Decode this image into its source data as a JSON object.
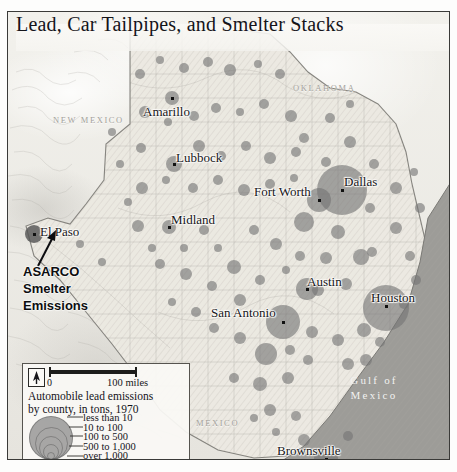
{
  "title": "Lead, Car Tailpipes, and Smelter Stacks",
  "regions": [
    {
      "name": "new-mexico",
      "label": "NEW MEXICO",
      "x": 45,
      "y": 103
    },
    {
      "name": "oklahoma",
      "label": "OKLAHOMA",
      "x": 285,
      "y": 71
    },
    {
      "name": "mexico",
      "label": "MEXICO",
      "x": 188,
      "y": 406
    }
  ],
  "water": {
    "name": "gulf-of-mexico",
    "line1": "Gulf of",
    "line2": "Mexico",
    "x": 366,
    "y": 381
  },
  "cities": [
    {
      "name": "amarillo",
      "label": "Amarillo",
      "lx": 135,
      "ly": 92,
      "dx": 164,
      "dy": 86
    },
    {
      "name": "lubbock",
      "label": "Lubbock",
      "lx": 168,
      "ly": 138,
      "dx": 166,
      "dy": 152
    },
    {
      "name": "midland",
      "label": "Midland",
      "lx": 163,
      "ly": 200,
      "dx": 161,
      "dy": 215
    },
    {
      "name": "el-paso",
      "label": "El Paso",
      "lx": 32,
      "ly": 212,
      "dx": 26,
      "dy": 222
    },
    {
      "name": "fort-worth",
      "label": "Fort Worth",
      "lx": 246,
      "ly": 172,
      "dx": 311,
      "dy": 188
    },
    {
      "name": "dallas",
      "label": "Dallas",
      "lx": 336,
      "ly": 162,
      "dx": 334,
      "dy": 178
    },
    {
      "name": "austin",
      "label": "Austin",
      "lx": 299,
      "ly": 262,
      "dx": 299,
      "dy": 277
    },
    {
      "name": "san-antonio",
      "label": "San Antonio",
      "lx": 203,
      "ly": 293,
      "dx": 275,
      "dy": 310
    },
    {
      "name": "houston",
      "label": "Houston",
      "lx": 363,
      "ly": 278,
      "dx": 378,
      "dy": 294
    },
    {
      "name": "brownsville",
      "label": "Brownsville",
      "lx": 269,
      "ly": 431,
      "dx": 318,
      "dy": 447
    }
  ],
  "annotation": {
    "name": "asarco-smelter-emissions",
    "lines": [
      "ASARCO",
      "Smelter",
      "Emissions"
    ]
  },
  "legend": {
    "scale_zero": "0",
    "scale_max": "100 miles",
    "caption_line1": "Automobile lead emissions",
    "caption_line2": "by county, in tons, 1970",
    "classes": [
      "less than 10",
      "10 to 100",
      "100 to 500",
      "500 to 1,000",
      "over 1,000"
    ],
    "class_radii_px": [
      3,
      7,
      11,
      15.5,
      21
    ],
    "north_arrow": "north-arrow-icon"
  },
  "chart_data": {
    "type": "map-proportional-symbols",
    "title": "Lead, Car Tailpipes, and Smelter Stacks",
    "variable": "Automobile lead emissions by county, in tons, 1970",
    "units": "tons",
    "year": 1970,
    "classes": [
      {
        "label": "less than 10",
        "min": 0,
        "max": 10
      },
      {
        "label": "10 to 100",
        "min": 10,
        "max": 100
      },
      {
        "label": "100 to 500",
        "min": 100,
        "max": 500
      },
      {
        "label": "500 to 1,000",
        "min": 500,
        "max": 1000
      },
      {
        "label": "over 1,000",
        "min": 1000,
        "max": null
      }
    ],
    "symbols": [
      {
        "x": 26,
        "y": 222,
        "r": 9,
        "cls": 4,
        "dark": true
      },
      {
        "x": 334,
        "y": 178,
        "r": 25,
        "cls": 4
      },
      {
        "x": 378,
        "y": 296,
        "r": 23,
        "cls": 4
      },
      {
        "x": 275,
        "y": 310,
        "r": 17,
        "cls": 3
      },
      {
        "x": 299,
        "y": 277,
        "r": 11,
        "cls": 3
      },
      {
        "x": 311,
        "y": 188,
        "r": 12,
        "cls": 3
      },
      {
        "x": 166,
        "y": 152,
        "r": 8,
        "cls": 2
      },
      {
        "x": 164,
        "y": 86,
        "r": 7,
        "cls": 2
      },
      {
        "x": 161,
        "y": 215,
        "r": 7,
        "cls": 2
      },
      {
        "x": 318,
        "y": 447,
        "r": 12,
        "cls": 3
      },
      {
        "x": 296,
        "y": 210,
        "r": 10,
        "cls": 3
      },
      {
        "x": 353,
        "y": 245,
        "r": 8,
        "cls": 2
      },
      {
        "x": 258,
        "y": 342,
        "r": 11,
        "cls": 3
      },
      {
        "x": 226,
        "y": 255,
        "r": 7,
        "cls": 2
      },
      {
        "x": 132,
        "y": 62,
        "r": 5,
        "cls": 2
      },
      {
        "x": 152,
        "y": 48,
        "r": 4,
        "cls": 1
      },
      {
        "x": 176,
        "y": 56,
        "r": 5,
        "cls": 2
      },
      {
        "x": 200,
        "y": 50,
        "r": 5,
        "cls": 2
      },
      {
        "x": 222,
        "y": 58,
        "r": 6,
        "cly": 0,
        "cls": 2
      },
      {
        "x": 250,
        "y": 52,
        "r": 4,
        "cls": 1
      },
      {
        "x": 272,
        "y": 62,
        "r": 5,
        "cls": 2
      },
      {
        "x": 137,
        "y": 100,
        "r": 6,
        "cls": 2
      },
      {
        "x": 160,
        "y": 110,
        "r": 4,
        "cls": 1
      },
      {
        "x": 186,
        "y": 104,
        "r": 5,
        "cls": 2
      },
      {
        "x": 208,
        "y": 96,
        "r": 5,
        "cls": 2
      },
      {
        "x": 232,
        "y": 100,
        "r": 4,
        "cls": 1
      },
      {
        "x": 256,
        "y": 92,
        "r": 5,
        "cls": 2
      },
      {
        "x": 283,
        "y": 104,
        "r": 6,
        "cls": 2
      },
      {
        "x": 133,
        "y": 136,
        "r": 5,
        "cls": 2
      },
      {
        "x": 191,
        "y": 134,
        "r": 6,
        "cls": 2
      },
      {
        "x": 213,
        "y": 144,
        "r": 5,
        "cls": 2
      },
      {
        "x": 238,
        "y": 134,
        "r": 5,
        "cls": 2
      },
      {
        "x": 262,
        "y": 146,
        "r": 6,
        "cls": 2
      },
      {
        "x": 288,
        "y": 140,
        "r": 5,
        "cls": 2
      },
      {
        "x": 134,
        "y": 176,
        "r": 6,
        "cls": 2
      },
      {
        "x": 158,
        "y": 168,
        "r": 4,
        "cls": 1
      },
      {
        "x": 185,
        "y": 176,
        "r": 5,
        "cls": 2
      },
      {
        "x": 210,
        "y": 168,
        "r": 5,
        "cls": 2
      },
      {
        "x": 236,
        "y": 178,
        "r": 6,
        "cls": 2
      },
      {
        "x": 262,
        "y": 172,
        "r": 5,
        "cls": 2
      },
      {
        "x": 286,
        "y": 166,
        "r": 4,
        "cls": 1
      },
      {
        "x": 342,
        "y": 130,
        "r": 6,
        "cls": 2
      },
      {
        "x": 366,
        "y": 152,
        "r": 5,
        "cls": 2
      },
      {
        "x": 388,
        "y": 176,
        "r": 6,
        "cls": 2
      },
      {
        "x": 362,
        "y": 196,
        "r": 5,
        "cls": 2
      },
      {
        "x": 388,
        "y": 216,
        "r": 6,
        "cls": 2
      },
      {
        "x": 330,
        "y": 220,
        "r": 7,
        "cls": 2
      },
      {
        "x": 318,
        "y": 246,
        "r": 6,
        "cls": 2
      },
      {
        "x": 292,
        "y": 244,
        "r": 5,
        "cls": 2
      },
      {
        "x": 268,
        "y": 232,
        "r": 6,
        "cls": 2
      },
      {
        "x": 246,
        "y": 218,
        "r": 5,
        "cls": 2
      },
      {
        "x": 196,
        "y": 218,
        "r": 5,
        "cls": 2
      },
      {
        "x": 130,
        "y": 214,
        "r": 6,
        "cls": 2
      },
      {
        "x": 152,
        "y": 252,
        "r": 5,
        "cls": 2
      },
      {
        "x": 178,
        "y": 262,
        "r": 6,
        "cls": 2
      },
      {
        "x": 204,
        "y": 274,
        "r": 5,
        "cls": 2
      },
      {
        "x": 232,
        "y": 288,
        "r": 6,
        "cls": 2
      },
      {
        "x": 252,
        "y": 268,
        "r": 5,
        "cls": 2
      },
      {
        "x": 278,
        "y": 258,
        "r": 4,
        "cls": 1
      },
      {
        "x": 310,
        "y": 278,
        "r": 6,
        "cls": 2
      },
      {
        "x": 338,
        "y": 272,
        "r": 6,
        "cls": 2
      },
      {
        "x": 356,
        "y": 318,
        "r": 7,
        "cls": 2
      },
      {
        "x": 330,
        "y": 328,
        "r": 6,
        "cls": 2
      },
      {
        "x": 304,
        "y": 320,
        "r": 6,
        "cls": 2
      },
      {
        "x": 282,
        "y": 338,
        "r": 5,
        "cls": 2
      },
      {
        "x": 232,
        "y": 326,
        "r": 6,
        "cls": 2
      },
      {
        "x": 206,
        "y": 316,
        "r": 5,
        "cls": 2
      },
      {
        "x": 188,
        "y": 300,
        "r": 5,
        "cls": 2
      },
      {
        "x": 164,
        "y": 290,
        "r": 4,
        "cls": 1
      },
      {
        "x": 252,
        "y": 372,
        "r": 7,
        "cls": 2
      },
      {
        "x": 280,
        "y": 366,
        "r": 6,
        "cls": 2
      },
      {
        "x": 300,
        "y": 348,
        "r": 5,
        "cls": 2
      },
      {
        "x": 226,
        "y": 366,
        "r": 5,
        "cls": 2
      },
      {
        "x": 262,
        "y": 398,
        "r": 6,
        "cls": 2
      },
      {
        "x": 288,
        "y": 404,
        "r": 5,
        "cls": 2
      },
      {
        "x": 296,
        "y": 428,
        "r": 6,
        "cls": 2
      },
      {
        "x": 340,
        "y": 424,
        "r": 5,
        "cls": 2
      },
      {
        "x": 268,
        "y": 420,
        "r": 4,
        "cls": 1
      },
      {
        "x": 246,
        "y": 406,
        "r": 4,
        "cls": 1
      },
      {
        "x": 364,
        "y": 240,
        "r": 5,
        "cls": 2
      },
      {
        "x": 402,
        "y": 244,
        "r": 5,
        "cls": 2
      },
      {
        "x": 408,
        "y": 268,
        "r": 5,
        "cls": 2
      },
      {
        "x": 396,
        "y": 292,
        "r": 5,
        "cls": 2
      },
      {
        "x": 412,
        "y": 196,
        "r": 5,
        "cls": 2
      },
      {
        "x": 406,
        "y": 160,
        "r": 4,
        "cls": 1
      },
      {
        "x": 318,
        "y": 150,
        "r": 5,
        "cls": 2
      },
      {
        "x": 296,
        "y": 126,
        "r": 5,
        "cls": 2
      },
      {
        "x": 322,
        "y": 106,
        "r": 5,
        "cls": 2
      },
      {
        "x": 342,
        "y": 92,
        "r": 4,
        "cls": 1
      },
      {
        "x": 176,
        "y": 236,
        "r": 4,
        "cls": 1
      },
      {
        "x": 144,
        "y": 236,
        "r": 4,
        "cls": 1
      },
      {
        "x": 120,
        "y": 190,
        "r": 4,
        "cls": 1
      },
      {
        "x": 112,
        "y": 152,
        "r": 4,
        "cls": 1
      },
      {
        "x": 104,
        "y": 120,
        "r": 4,
        "cls": 1
      },
      {
        "x": 94,
        "y": 250,
        "r": 4,
        "cls": 1
      },
      {
        "x": 72,
        "y": 232,
        "r": 4,
        "cls": 1
      },
      {
        "x": 210,
        "y": 236,
        "r": 4,
        "cls": 1
      },
      {
        "x": 340,
        "y": 352,
        "r": 6,
        "cls": 2
      },
      {
        "x": 372,
        "y": 330,
        "r": 5,
        "cls": 2
      },
      {
        "x": 358,
        "y": 348,
        "r": 6,
        "cls": 2
      }
    ]
  }
}
